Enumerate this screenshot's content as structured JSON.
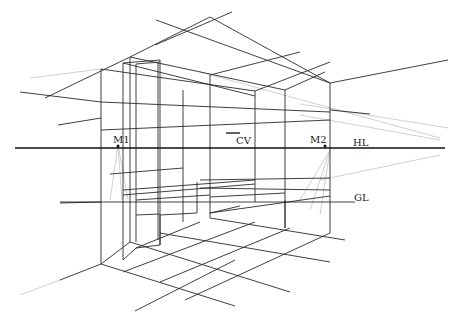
{
  "diagram": {
    "labels": {
      "m1": "M1",
      "cv": "CV",
      "m2": "M2",
      "hl": "HL",
      "gl": "GL"
    },
    "colors": {
      "line": "#1a1a1a",
      "faint": "#9a9a9a",
      "background": "#ffffff"
    },
    "lines": {
      "horizon": [
        [
          15,
          148
        ],
        [
          445,
          148
        ]
      ],
      "ground": [
        [
          60,
          202
        ],
        [
          355,
          202
        ]
      ],
      "heavy": [
        [
          [
            210,
            17
          ],
          [
            130,
            57
          ]
        ],
        [
          [
            210,
            17
          ],
          [
            330,
            83
          ]
        ],
        [
          [
            330,
            83
          ],
          [
            448,
            60
          ]
        ],
        [
          [
            130,
            57
          ],
          [
            45,
            98
          ]
        ],
        [
          [
            101,
            69
          ],
          [
            101,
            264
          ]
        ],
        [
          [
            330,
            83
          ],
          [
            330,
            233
          ]
        ],
        [
          [
            101,
            264
          ],
          [
            60,
            280
          ]
        ],
        [
          [
            101,
            264
          ],
          [
            235,
            306
          ]
        ],
        [
          [
            330,
            233
          ],
          [
            185,
            300
          ]
        ],
        [
          [
            330,
            233
          ],
          [
            345,
            240
          ]
        ],
        [
          [
            135,
            310
          ],
          [
            235,
            260
          ]
        ]
      ],
      "medium": [
        [
          [
            130,
            57
          ],
          [
            130,
            242
          ]
        ],
        [
          [
            130,
            57
          ],
          [
            255,
            96
          ]
        ],
        [
          [
            160,
            63
          ],
          [
            160,
            243
          ]
        ],
        [
          [
            160,
            63
          ],
          [
            128,
            62
          ]
        ],
        [
          [
            210,
            17
          ],
          [
            205,
            75
          ]
        ],
        [
          [
            183,
            90
          ],
          [
            183,
            225
          ]
        ],
        [
          [
            255,
            96
          ],
          [
            255,
            195
          ]
        ],
        [
          [
            285,
            90
          ],
          [
            285,
            230
          ]
        ],
        [
          [
            130,
            242
          ],
          [
            160,
            243
          ]
        ],
        [
          [
            160,
            243
          ],
          [
            160,
            225
          ]
        ],
        [
          [
            101,
            264
          ],
          [
            130,
            242
          ]
        ],
        [
          [
            135,
            305
          ],
          [
            255,
            255
          ]
        ],
        [
          [
            115,
            288
          ],
          [
            200,
            258
          ]
        ],
        [
          [
            168,
            286
          ],
          [
            305,
            245
          ]
        ],
        [
          [
            160,
            277
          ],
          [
            285,
            238
          ]
        ],
        [
          [
            130,
            242
          ],
          [
            290,
            300
          ]
        ],
        [
          [
            165,
            230
          ],
          [
            330,
            280
          ]
        ],
        [
          [
            205,
            215
          ],
          [
            340,
            258
          ]
        ],
        [
          [
            235,
            203
          ],
          [
            330,
            233
          ]
        ],
        [
          [
            130,
            194
          ],
          [
            255,
            175
          ]
        ],
        [
          [
            160,
            195
          ],
          [
            255,
            185
          ]
        ],
        [
          [
            197,
            175
          ],
          [
            330,
            178
          ]
        ],
        [
          [
            205,
            195
          ],
          [
            330,
            210
          ]
        ],
        [
          [
            205,
            205
          ],
          [
            255,
            190
          ]
        ],
        [
          [
            30,
            170
          ],
          [
            330,
            120
          ]
        ],
        [
          [
            101,
            118
          ],
          [
            330,
            105
          ]
        ],
        [
          [
            130,
            100
          ],
          [
            330,
            100
          ]
        ],
        [
          [
            45,
            125
          ],
          [
            130,
            117
          ]
        ]
      ]
    }
  }
}
